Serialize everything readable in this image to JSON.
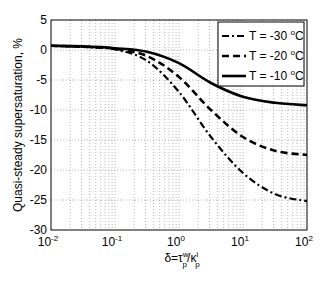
{
  "chart_data": {
    "type": "line",
    "title": "",
    "xlabel": "δ=τ_p^w/κ_p^i",
    "ylabel": "Quasi-steady supersaturation, %",
    "xscale": "log",
    "xlim": [
      0.01,
      100
    ],
    "ylim": [
      -30,
      5
    ],
    "grid": true,
    "legend_position": "upper right",
    "x_tick_labels": [
      "10^-2",
      "10^-1",
      "10^0",
      "10^1",
      "10^2"
    ],
    "y_tick_labels": [
      "5",
      "0",
      "-5",
      "-10",
      "-15",
      "-20",
      "-25",
      "-30"
    ],
    "x": [
      0.01,
      0.0316,
      0.1,
      0.316,
      1,
      3.16,
      10,
      31.6,
      100
    ],
    "series": [
      {
        "name": "T = -30 °C",
        "style": "dash-dot",
        "values": [
          0.7,
          0.5,
          0.1,
          -1.8,
          -7.0,
          -14.5,
          -20.5,
          -24.0,
          -25.2
        ]
      },
      {
        "name": "T = -20 °C",
        "style": "dashed",
        "values": [
          0.7,
          0.55,
          0.2,
          -1.0,
          -4.5,
          -10.0,
          -14.5,
          -16.8,
          -17.5
        ]
      },
      {
        "name": "T = -10 °C",
        "style": "solid",
        "values": [
          0.7,
          0.6,
          0.3,
          -0.3,
          -2.2,
          -5.5,
          -7.8,
          -8.8,
          -9.2
        ]
      }
    ]
  },
  "labels": {
    "ylabel": "Quasi-steady supersaturation, %",
    "xlabel_prefix": "δ=τ",
    "xlabel_sup1": "w",
    "xlabel_sub1": "p",
    "xlabel_mid": "/κ",
    "xlabel_sup2": "i",
    "xlabel_sub2": "p",
    "legend": [
      "T = -30 ",
      "T = -20 ",
      "T = -10 "
    ],
    "legend_unit_sup": "o",
    "legend_unit": "C"
  }
}
